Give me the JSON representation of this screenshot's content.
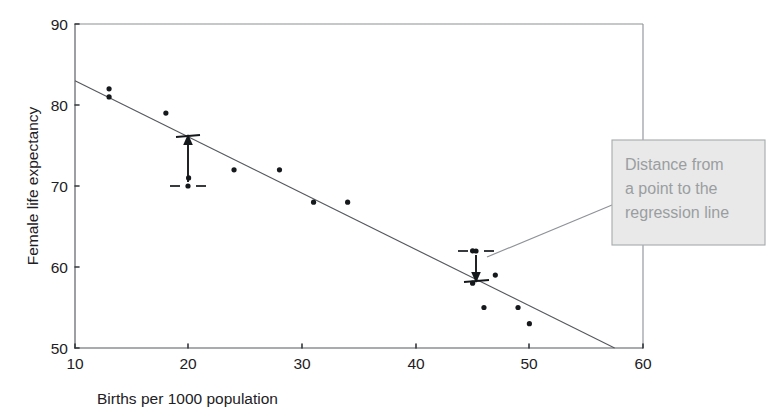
{
  "chart_data": {
    "type": "scatter",
    "title": "",
    "xlabel": "Births per 1000 population",
    "ylabel": "Female life expectancy",
    "xlim": [
      10,
      60
    ],
    "ylim": [
      50,
      90
    ],
    "xticks": [
      10,
      20,
      30,
      40,
      50,
      60
    ],
    "yticks": [
      50,
      60,
      70,
      80,
      90
    ],
    "xtick_labels": [
      "10",
      "20",
      "30",
      "40",
      "50",
      "60"
    ],
    "ytick_labels": [
      "50",
      "60",
      "70",
      "80",
      "90"
    ],
    "grid": false,
    "legend": null,
    "points": [
      {
        "x": 13,
        "y": 82
      },
      {
        "x": 13,
        "y": 81
      },
      {
        "x": 18,
        "y": 79
      },
      {
        "x": 20,
        "y": 71
      },
      {
        "x": 24,
        "y": 72
      },
      {
        "x": 28,
        "y": 72
      },
      {
        "x": 31,
        "y": 68
      },
      {
        "x": 34,
        "y": 68
      },
      {
        "x": 45,
        "y": 62
      },
      {
        "x": 45,
        "y": 58
      },
      {
        "x": 46,
        "y": 55
      },
      {
        "x": 47,
        "y": 59
      },
      {
        "x": 49,
        "y": 55
      },
      {
        "x": 50,
        "y": 53
      }
    ],
    "series": [
      {
        "name": "regression line",
        "type": "line",
        "x": [
          10,
          57.5
        ],
        "y": [
          83,
          50
        ]
      }
    ],
    "annotations": [
      {
        "name": "residual-marker-lower",
        "point_x": 20,
        "point_y": 71,
        "line_y": 76,
        "direction": "up"
      },
      {
        "name": "residual-marker-upper",
        "point_x": 45,
        "point_y": 62,
        "line_y": 58.6,
        "direction": "down"
      }
    ]
  },
  "callout": {
    "line1": "Distance from",
    "line2": "a point to the",
    "line3": "regression line"
  },
  "colors": {
    "point": "#16191c",
    "regression_line": "#55595d",
    "axis": "#555a5e",
    "callout_fill": "#e9e9e9",
    "callout_border": "#a9adb0",
    "callout_text": "#9a9ea1",
    "annotation": "#15181b",
    "background": "#ffffff"
  }
}
